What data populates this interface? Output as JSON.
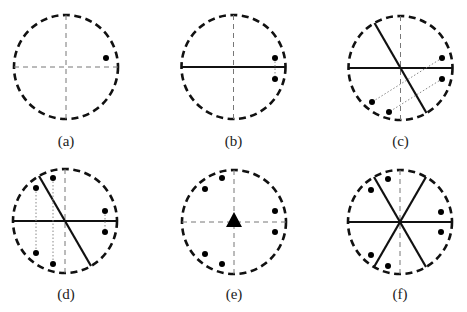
{
  "figure": {
    "panels": [
      {
        "id": "a",
        "label": "(a)"
      },
      {
        "id": "b",
        "label": "(b)"
      },
      {
        "id": "c",
        "label": "(c)"
      },
      {
        "id": "d",
        "label": "(d)"
      },
      {
        "id": "e",
        "label": "(e)"
      },
      {
        "id": "f",
        "label": "(f)"
      }
    ],
    "colors": {
      "stroke": "#111111",
      "axis": "#777777",
      "guide": "#888888"
    }
  }
}
